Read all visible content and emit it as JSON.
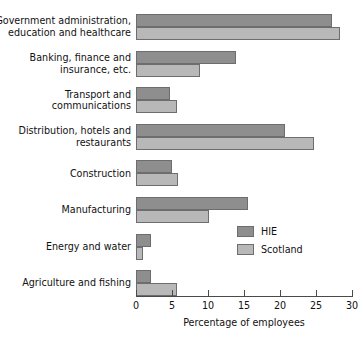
{
  "chart_data": {
    "type": "bar",
    "orientation": "horizontal",
    "title": "",
    "xlabel": "Percentage of employees",
    "ylabel": "",
    "xlim": [
      0,
      30
    ],
    "xticks": [
      0,
      5,
      10,
      15,
      20,
      25,
      30
    ],
    "grid": false,
    "legend_position": "middle-right",
    "categories": [
      "Government administration, education and healthcare",
      "Banking, finance and insurance, etc.",
      "Transport and communications",
      "Distribution, hotels and restaurants",
      "Construction",
      "Manufacturing",
      "Energy and water",
      "Agriculture and fishing"
    ],
    "category_lines": [
      [
        "Government administration,",
        "education and healthcare"
      ],
      [
        "Banking, finance and",
        "insurance, etc."
      ],
      [
        "Transport and",
        "communications"
      ],
      [
        "Distribution, hotels and",
        "restaurants"
      ],
      [
        "Construction"
      ],
      [
        "Manufacturing"
      ],
      [
        "Energy and water"
      ],
      [
        "Agriculture and fishing"
      ]
    ],
    "series": [
      {
        "name": "HIE",
        "color": "#8e8e8e",
        "values": [
          27.2,
          13.9,
          4.7,
          20.7,
          5.0,
          15.5,
          2.1,
          2.1
        ]
      },
      {
        "name": "Scotland",
        "color": "#b8b8b8",
        "values": [
          28.3,
          8.9,
          5.7,
          24.7,
          5.8,
          10.2,
          1.0,
          5.7
        ]
      }
    ]
  },
  "legend": {
    "items": [
      {
        "label": "HIE",
        "color": "#8e8e8e"
      },
      {
        "label": "Scotland",
        "color": "#b8b8b8"
      }
    ]
  },
  "axis": {
    "title": "Percentage of employees",
    "tick_labels": [
      "0",
      "5",
      "10",
      "15",
      "20",
      "25",
      "30"
    ]
  }
}
